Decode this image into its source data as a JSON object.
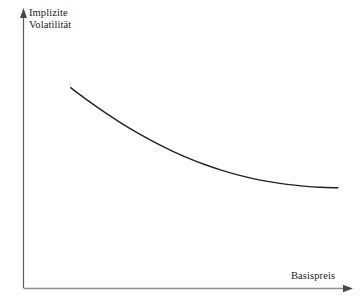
{
  "figure": {
    "background_color": "#ffffff",
    "width": 362,
    "height": 305
  },
  "axes": {
    "y_axis": {
      "label_line1": "Implizite",
      "label_line2": "Volatilität",
      "has_arrowhead": true,
      "color": "#555555"
    },
    "x_axis": {
      "label": "Basispreis",
      "has_arrowhead": true,
      "color": "#888888"
    }
  },
  "chart_data": {
    "type": "line",
    "title": "",
    "subtitle": "",
    "xlabel": "Basispreis",
    "ylabel": "Implizite Volatilität",
    "grid": false,
    "legend": null,
    "legend_position": "none",
    "xlim": [
      0,
      100
    ],
    "ylim": [
      0,
      100
    ],
    "x_tick_labels": [],
    "y_tick_labels": [],
    "annotations": [],
    "series": [
      {
        "name": "Implizite Volatilität",
        "color": "#222222",
        "linewidth": 1.4,
        "x": [
          14.3,
          20.0,
          25.0,
          30.0,
          35.0,
          40.0,
          45.0,
          50.0,
          55.0,
          60.0,
          65.0,
          70.0,
          75.0,
          80.0,
          85.0,
          90.0,
          95.4
        ],
        "y": [
          71.6,
          66.6,
          62.5,
          58.7,
          55.2,
          52.0,
          49.1,
          46.5,
          44.2,
          42.2,
          40.5,
          39.1,
          38.0,
          37.1,
          36.5,
          36.1,
          35.9
        ]
      }
    ]
  }
}
